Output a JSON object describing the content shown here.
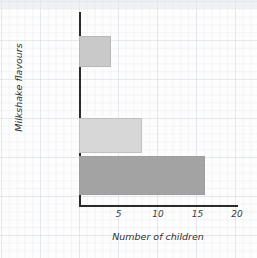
{
  "chart_data": {
    "type": "bar",
    "orientation": "horizontal",
    "title": "",
    "xlabel": "Number of children",
    "ylabel": "Milkshake flavours",
    "categories": [
      "Banana Bliss",
      "Vanilla Dream",
      "Cheeky Choc",
      "Merry Berry"
    ],
    "values": [
      4,
      0,
      8,
      16
    ],
    "xlim": [
      0,
      20
    ],
    "xticks": [
      5,
      10,
      15,
      20
    ],
    "xtick_labels": [
      "5",
      "10",
      "15",
      "20"
    ],
    "grid": true,
    "grid_style": "graph-paper",
    "legend": null,
    "bar_colors": [
      "#c9c9c9",
      "#ffffff",
      "#d7d7d7",
      "#a3a3a3"
    ],
    "axis_color": "#2b2b2b",
    "background_color": "#fdfdfd"
  },
  "bars": [
    {
      "label": "Banana\nBliss",
      "value": 4,
      "color": "#c9c9c9"
    },
    {
      "label": "Vanilla\nDream",
      "value": 0,
      "color": "#ffffff"
    },
    {
      "label": "Cheeky\nChoc",
      "value": 8,
      "color": "#d7d7d7"
    },
    {
      "label": "Merry\nBerry",
      "value": 16,
      "color": "#a3a3a3"
    }
  ],
  "xticks": [
    {
      "label": "5",
      "value": 5
    },
    {
      "label": "10",
      "value": 10
    },
    {
      "label": "15",
      "value": 15
    },
    {
      "label": "20",
      "value": 20
    }
  ]
}
